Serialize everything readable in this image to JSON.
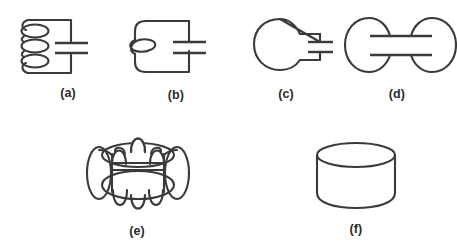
{
  "figure": {
    "background_color": "#ffffff",
    "stroke_color": "#3a3a3a",
    "width": 457,
    "height": 250
  },
  "panels": [
    {
      "id": "a",
      "caption": "(a)",
      "caption_x": 68,
      "caption_y": 97,
      "name": "coil-capacitor-three-loops",
      "description": "Closed loop circuit with a three-turn inductor coil on the left side and a parallel-plate capacitor gap on the right side"
    },
    {
      "id": "b",
      "caption": "(b)",
      "caption_x": 176,
      "caption_y": 99,
      "name": "single-loop-capacitor",
      "description": "Closed loop circuit with one crossing loop on the left side and a parallel-plate capacitor gap on the right side"
    },
    {
      "id": "c",
      "caption": "(c)",
      "caption_x": 286,
      "caption_y": 98,
      "name": "blob-with-two-prongs",
      "description": "Rounded blob body with two prongs projecting to the right ending in two capacitor plates"
    },
    {
      "id": "d",
      "caption": "(d)",
      "caption_x": 397,
      "caption_y": 98,
      "name": "dumbbell-two-ellipses",
      "description": "Two ellipses joined by a short neck with two horizontal plate lines crossing the neck"
    },
    {
      "id": "e",
      "caption": "(e)",
      "caption_x": 137,
      "caption_y": 235,
      "name": "multi-handle-cage",
      "description": "Complex three dimensional cage: a cylinder body with two large horizontal ellipses and six arched handles on top, bottom and sides"
    },
    {
      "id": "f",
      "caption": "(f)",
      "caption_x": 356,
      "caption_y": 233,
      "name": "cylinder-solid",
      "description": "Plain three dimensional cylinder drawn with an elliptical top face and a curved bottom edge"
    }
  ]
}
